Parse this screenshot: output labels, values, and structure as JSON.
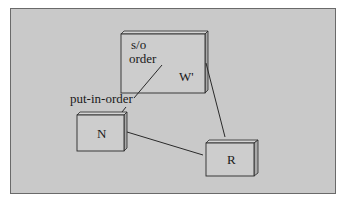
{
  "diagram": {
    "background_color": "#c9c9c9",
    "nodes": [
      {
        "id": "W",
        "label": "W'",
        "inner_text": [
          "s/o",
          "order"
        ]
      },
      {
        "id": "N",
        "label": "N"
      },
      {
        "id": "R",
        "label": "R"
      }
    ],
    "edges": [
      {
        "from": "W",
        "to": "N",
        "label": "put-in-order"
      },
      {
        "from": "N",
        "to": "R",
        "label": ""
      },
      {
        "from": "W",
        "to": "R",
        "label": ""
      }
    ]
  }
}
